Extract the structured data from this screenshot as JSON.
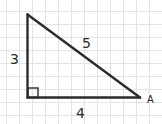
{
  "diagram": {
    "type": "right-triangle",
    "background": "#ffffff",
    "grid": {
      "color": "#e2e2e2",
      "spacing": 13
    },
    "stroke_color": "#2b2b2b",
    "sides": {
      "vertical": "3",
      "hypotenuse": "5",
      "horizontal": "4"
    },
    "vertex_label": "A",
    "right_angle_marker": true
  }
}
